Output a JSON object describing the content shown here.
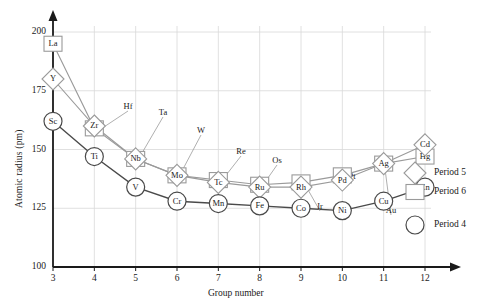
{
  "chart_data": {
    "type": "line",
    "title": "",
    "xlabel": "Group number",
    "ylabel": "Atomic radius (pm)",
    "xlim": [
      3,
      12
    ],
    "ylim": [
      100,
      200
    ],
    "xticks": [
      3,
      4,
      5,
      6,
      7,
      8,
      9,
      10,
      11,
      12
    ],
    "yticks": [
      100,
      125,
      150,
      175,
      200
    ],
    "grid": true,
    "legend_position": "right-inline",
    "x": [
      3,
      4,
      5,
      6,
      7,
      8,
      9,
      10,
      11,
      12
    ],
    "series": [
      {
        "name": "Period 4",
        "marker": "circle",
        "color": "#4a4a4a",
        "point_labels": [
          "Sc",
          "Ti",
          "V",
          "Cr",
          "Mn",
          "Fe",
          "Co",
          "Ni",
          "Cu",
          "Zn"
        ],
        "values": [
          162,
          147,
          134,
          128,
          127,
          126,
          125,
          124,
          128,
          134
        ]
      },
      {
        "name": "Period 5",
        "marker": "diamond",
        "color": "#9a9a9a",
        "point_labels": [
          "Y",
          "Zr",
          "Nb",
          "Mo",
          "Tc",
          "Ru",
          "Rh",
          "Pd",
          "Ag",
          "Cd"
        ],
        "values": [
          180,
          160,
          146,
          139,
          136,
          134,
          134,
          137,
          144,
          152
        ]
      },
      {
        "name": "Period 6",
        "marker": "square",
        "color": "#9a9a9a",
        "point_labels": [
          "La",
          "Hf",
          "Ta",
          "W",
          "Re",
          "Os",
          "Ir",
          "Pt",
          "Au",
          "Hg"
        ],
        "values": [
          195,
          159,
          146,
          139,
          137,
          135,
          136,
          139,
          144,
          147
        ]
      }
    ],
    "callouts": [
      {
        "label": "Hf",
        "series": "Period 6",
        "x": 4
      },
      {
        "label": "Ta",
        "series": "Period 6",
        "x": 5
      },
      {
        "label": "W",
        "series": "Period 6",
        "x": 6
      },
      {
        "label": "Re",
        "series": "Period 6",
        "x": 7
      },
      {
        "label": "Os",
        "series": "Period 6",
        "x": 8
      },
      {
        "label": "Ir",
        "series": "Period 6",
        "x": 9
      },
      {
        "label": "Pt",
        "series": "Period 6",
        "x": 10
      },
      {
        "label": "Au",
        "series": "Period 6",
        "x": 11
      }
    ],
    "legend_entries": [
      {
        "label": "Period 5",
        "marker": "diamond"
      },
      {
        "label": "Period 6",
        "marker": "square"
      },
      {
        "label": "Period 4",
        "marker": "circle"
      }
    ]
  }
}
